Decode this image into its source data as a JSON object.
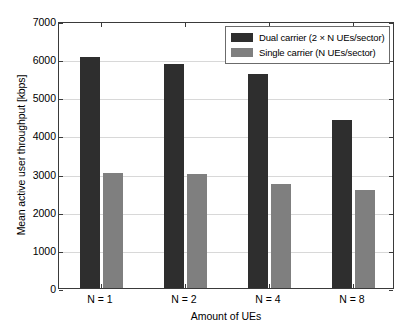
{
  "chart_data": {
    "type": "bar",
    "title": "",
    "xlabel": "Amount of UEs",
    "ylabel": "Mean active user throughput [kbps]",
    "categories": [
      "N = 1",
      "N = 2",
      "N = 4",
      "N = 8"
    ],
    "series": [
      {
        "name": "Dual carrier (2 × N UEs/sector)",
        "color": "#2e2e2e",
        "values": [
          6060,
          5880,
          5620,
          4400
        ]
      },
      {
        "name": "Single carrier (N UEs/sector)",
        "color": "#7f7f7f",
        "values": [
          3010,
          2980,
          2720,
          2570
        ]
      }
    ],
    "ylim": [
      0,
      7000
    ],
    "yticks": [
      0,
      1000,
      2000,
      3000,
      4000,
      5000,
      6000,
      7000
    ],
    "ytick_labels": [
      "0",
      "1000",
      "2000",
      "3000",
      "4000",
      "5000",
      "6000",
      "7000"
    ],
    "grid": true,
    "grid_axis": "y",
    "legend_position": "top-right",
    "legend": [
      "Dual carrier (2 × N UEs/sector)",
      "Single carrier (N UEs/sector)"
    ]
  }
}
